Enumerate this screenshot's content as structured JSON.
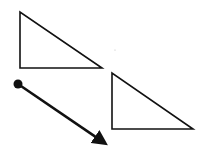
{
  "diagram": {
    "title": "Translation of a right triangle along a vector",
    "background": "#ffffff",
    "stroke_color": "#111111",
    "shapes": {
      "original_triangle": {
        "label": "original triangle",
        "points": "20,12 20,68 102,68",
        "stroke_width": 1.6
      },
      "image_triangle": {
        "label": "translated triangle",
        "points": "112,73 112,129 193,129",
        "stroke_width": 1.6
      },
      "translation_vector": {
        "label": "translation vector",
        "start": {
          "x": 18,
          "y": 84
        },
        "end": {
          "x": 109,
          "y": 146
        },
        "start_dot_radius": 4.5,
        "stroke_width": 2.6
      },
      "speck": {
        "x": 115,
        "y": 50,
        "r": 0.6,
        "color": "#bbbbbb"
      }
    }
  }
}
